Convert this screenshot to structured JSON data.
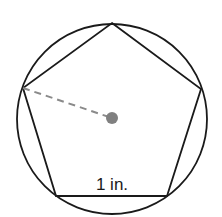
{
  "diagram": {
    "side_label": "1 in.",
    "colors": {
      "stroke": "#1a1a1a",
      "radius_dash": "#8a8a8a",
      "center_dot": "#808080",
      "background": "#ffffff"
    }
  }
}
